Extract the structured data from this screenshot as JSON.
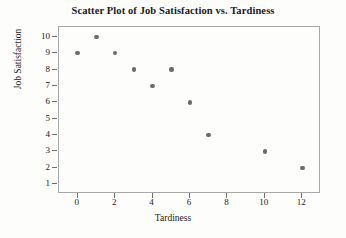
{
  "chart_data": {
    "type": "scatter",
    "title": "Scatter Plot of Job Satisfaction vs. Tardiness",
    "xlabel": "Tardiness",
    "ylabel": "Job Satisfaction",
    "xlim": [
      -1,
      13
    ],
    "ylim": [
      0.4,
      10.6
    ],
    "xticks": [
      0,
      2,
      4,
      6,
      8,
      10,
      12
    ],
    "yticks": [
      1,
      2,
      3,
      4,
      5,
      6,
      7,
      8,
      9,
      10
    ],
    "grid": false,
    "legend": null,
    "marker_color": "#6b6b6b",
    "frame_color": "#a8a8a8",
    "points": [
      {
        "x": 0,
        "y": 9
      },
      {
        "x": 1,
        "y": 10
      },
      {
        "x": 2,
        "y": 9
      },
      {
        "x": 3,
        "y": 8
      },
      {
        "x": 4,
        "y": 7
      },
      {
        "x": 5,
        "y": 8
      },
      {
        "x": 6,
        "y": 6
      },
      {
        "x": 7,
        "y": 4
      },
      {
        "x": 10,
        "y": 3
      },
      {
        "x": 12,
        "y": 2
      }
    ]
  }
}
